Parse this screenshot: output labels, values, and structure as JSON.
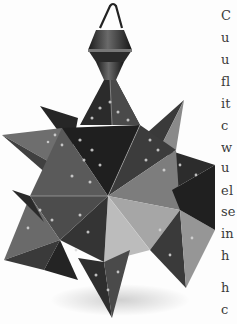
{
  "figure": {
    "icon": "star-lantern-photo"
  },
  "text_column": {
    "note": "right margin body text, cropped at page edge",
    "lines": [
      {
        "text": "C",
        "top": 9
      },
      {
        "text": "u",
        "top": 31
      },
      {
        "text": "u",
        "top": 53
      },
      {
        "text": "fl",
        "top": 75
      },
      {
        "text": "it",
        "top": 97
      },
      {
        "text": "c",
        "top": 119
      },
      {
        "text": "w",
        "top": 141
      },
      {
        "text": "u",
        "top": 161
      },
      {
        "text": "el",
        "top": 184
      },
      {
        "text": "se",
        "top": 205
      },
      {
        "text": "in",
        "top": 227
      },
      {
        "text": "h",
        "top": 249
      },
      {
        "text": "h",
        "top": 281
      },
      {
        "text": "c",
        "top": 303
      }
    ]
  },
  "colors": {
    "paper": "#fdfdfd",
    "text": "#3a3a3a",
    "metal_dark": "#1e1e1e",
    "metal_mid": "#5a5a5a",
    "metal_light": "#a8a8a8"
  }
}
